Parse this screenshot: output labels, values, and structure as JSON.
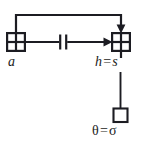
{
  "diagram": {
    "type": "block-diagram",
    "background_color": "#ffffff",
    "stroke_color": "#1c1c22",
    "nodes": [
      {
        "id": "node-a",
        "shape": "crossed-square",
        "label": "a",
        "label_parts": [
          {
            "text": "a",
            "style": "italic"
          }
        ],
        "x": 7,
        "y": 33,
        "w": 18,
        "h": 18
      },
      {
        "id": "node-h-s",
        "shape": "crossed-square",
        "label": "h = s",
        "label_parts": [
          {
            "text": "h",
            "style": "italic"
          },
          {
            "text": "=",
            "style": "roman"
          },
          {
            "text": "s",
            "style": "italic"
          }
        ],
        "x": 112,
        "y": 33,
        "w": 18,
        "h": 18
      },
      {
        "id": "node-theta-sigma",
        "shape": "empty-square",
        "label": "θ = σ",
        "label_parts": [
          {
            "text": "θ",
            "style": "greek"
          },
          {
            "text": "=",
            "style": "roman"
          },
          {
            "text": "σ",
            "style": "greek"
          }
        ],
        "x": 113,
        "y": 108,
        "w": 14,
        "h": 14
      }
    ],
    "edges": [
      {
        "id": "edge-a-to-hs",
        "from": "node-a",
        "to": "node-h-s",
        "orientation": "horizontal",
        "arrowhead": "right",
        "element": "capacitor"
      },
      {
        "id": "edge-feedback-loop",
        "from": "node-a",
        "to": "node-h-s",
        "orientation": "top-loop",
        "arrowhead": "down",
        "element": "none"
      },
      {
        "id": "edge-hs-to-theta",
        "from": "node-h-s",
        "to": "node-theta-sigma",
        "orientation": "vertical",
        "arrowhead": "none",
        "element": "none"
      }
    ],
    "symbols": [
      {
        "id": "capacitor-symbol",
        "name": "capacitor-icon",
        "x": 60,
        "y": 42
      }
    ]
  },
  "labels": {
    "a": "a",
    "h": "h",
    "s": "s",
    "theta": "θ",
    "sigma": "σ",
    "equals": "="
  }
}
